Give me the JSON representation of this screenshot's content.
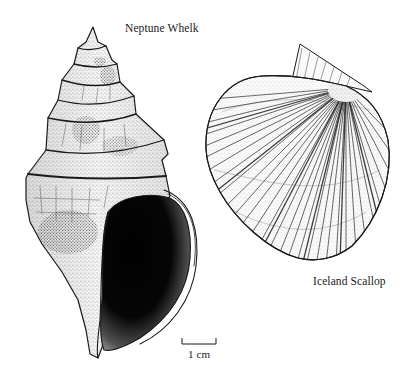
{
  "figure": {
    "background": "#ffffff",
    "ink_color": "#1a1a1a",
    "specimens": [
      {
        "name": "Neptune Whelk",
        "type": "gastropod",
        "position": "left"
      },
      {
        "name": "Iceland Scallop",
        "type": "bivalve",
        "position": "right"
      }
    ],
    "labels": {
      "whelk": "Neptune Whelk",
      "scallop": "Iceland Scallop"
    },
    "scale_bar": {
      "label": "1 cm",
      "length_px": 34
    }
  }
}
